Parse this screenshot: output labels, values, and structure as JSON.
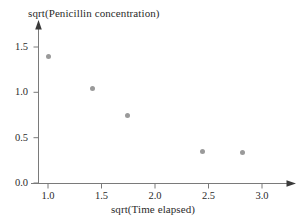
{
  "chart_data": {
    "type": "scatter",
    "title": "",
    "xlabel": "sqrt(Time elapsed)",
    "ylabel": "sqrt(Penicillin concentration)",
    "xlim": [
      0.72,
      3.3
    ],
    "ylim": [
      -0.08,
      1.7
    ],
    "xticks": [
      "1.0",
      "1.5",
      "2.0",
      "2.5",
      "3.0"
    ],
    "xtick_values": [
      1.0,
      1.5,
      2.0,
      2.5,
      3.0
    ],
    "yticks": [
      "0.0",
      "0.5",
      "1.0",
      "1.5"
    ],
    "ytick_values": [
      0.0,
      0.5,
      1.0,
      1.5
    ],
    "grid": false,
    "legend": null,
    "marker": {
      "shape": "circle",
      "color": "#9a9a9a",
      "size_px": 5
    },
    "axis_color": "#6d6d6d",
    "points": [
      {
        "x": 1.0,
        "y": 1.39
      },
      {
        "x": 1.42,
        "y": 1.04
      },
      {
        "x": 1.74,
        "y": 0.75
      },
      {
        "x": 2.44,
        "y": 0.35
      },
      {
        "x": 2.82,
        "y": 0.34
      }
    ]
  }
}
